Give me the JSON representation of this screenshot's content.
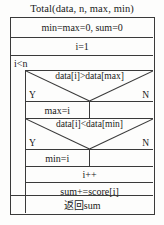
{
  "diagram": {
    "type": "nassi-shneiderman-flowchart",
    "title": "Total(data, n, max, min)",
    "colors": {
      "background": "#fdfdfc",
      "line": "#3a3a3a",
      "text": "#1a1a1a"
    },
    "labels": {
      "yes": "Y",
      "no": "N"
    },
    "rows": {
      "init": "min=max=0, sum=0",
      "counter_init": "i=1",
      "loop_condition": "i<n",
      "condition_max": "data[i]>data[max]",
      "assign_max": "max=i",
      "assign_max_else": "",
      "condition_min": "data[i]<data[min]",
      "assign_min": "min=i",
      "assign_min_else": "",
      "increment": "i++",
      "accumulate": "sum+=score[i]",
      "return": "返回sum"
    }
  }
}
